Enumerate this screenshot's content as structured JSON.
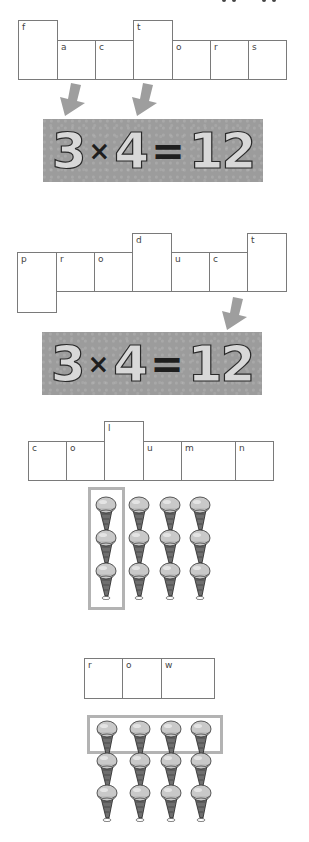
{
  "page": {
    "top_cutoff_text": "..."
  },
  "sections": [
    {
      "word": "factors",
      "letters": [
        "f",
        "a",
        "c",
        "t",
        "o",
        "r",
        "s"
      ],
      "highlighted_letters": [
        "f",
        "t"
      ],
      "arrows": [
        "arrow-to-3",
        "arrow-to-4"
      ]
    },
    {
      "word": "product",
      "letters": [
        "p",
        "r",
        "o",
        "d",
        "u",
        "c",
        "t"
      ],
      "highlighted_letters": [
        "p",
        "d",
        "t"
      ],
      "arrows": [
        "arrow-to-12"
      ]
    },
    {
      "word": "column",
      "letters": [
        "c",
        "o",
        "l",
        "u",
        "m",
        "n"
      ],
      "highlighted_letters": [
        "l"
      ]
    },
    {
      "word": "row",
      "letters": [
        "r",
        "o",
        "w"
      ]
    }
  ],
  "equations": [
    {
      "a": "3",
      "op": "×",
      "b": "4",
      "eq": "=",
      "result": "12"
    },
    {
      "a": "3",
      "op": "×",
      "b": "4",
      "eq": "=",
      "result": "12"
    }
  ],
  "arrays": [
    {
      "rows": 3,
      "columns": 4,
      "highlight": "first column",
      "item": "ice-cream-cone"
    },
    {
      "rows": 3,
      "columns": 4,
      "highlight": "first row",
      "item": "ice-cream-cone"
    }
  ],
  "colors": {
    "band": "#9c9c9c",
    "arrow": "#9e9e9e",
    "highlight": "#b3b3b3",
    "box_border": "#7a7a7a"
  }
}
